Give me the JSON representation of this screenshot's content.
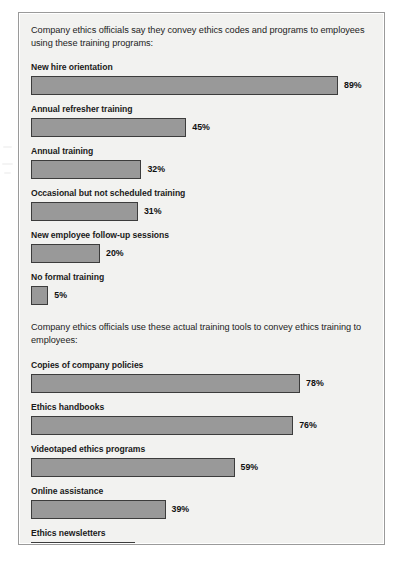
{
  "figure": {
    "background_color": "#f2f2f0",
    "frame_color": "#9a9a9a",
    "bar_fill_color": "#999999",
    "bar_border_color": "#3c3c3c",
    "text_color": "#232323"
  },
  "sections": [
    {
      "intro": "Company ethics officials say they convey ethics codes and programs to employees using these training programs:",
      "items": [
        {
          "label": "New hire orientation",
          "value": 89,
          "value_label": "89%"
        },
        {
          "label": "Annual refresher training",
          "value": 45,
          "value_label": "45%"
        },
        {
          "label": "Annual training",
          "value": 32,
          "value_label": "32%"
        },
        {
          "label": "Occasional but not scheduled training",
          "value": 31,
          "value_label": "31%"
        },
        {
          "label": "New employee follow-up sessions",
          "value": 20,
          "value_label": "20%"
        },
        {
          "label": "No formal training",
          "value": 5,
          "value_label": "5%"
        }
      ]
    },
    {
      "intro": "Company ethics officials use these actual training tools to convey ethics training to employees:",
      "items": [
        {
          "label": "Copies of company policies",
          "value": 78,
          "value_label": "78%"
        },
        {
          "label": "Ethics handbooks",
          "value": 76,
          "value_label": "76%"
        },
        {
          "label": "Videotaped ethics programs",
          "value": 59,
          "value_label": "59%"
        },
        {
          "label": "Online assistance",
          "value": 39,
          "value_label": "39%"
        },
        {
          "label": "Ethics newsletters",
          "value": 30,
          "value_label": "30%"
        }
      ]
    }
  ],
  "chart_data": {
    "type": "bar",
    "orientation": "horizontal",
    "title": "",
    "xlabel": "",
    "ylabel": "",
    "xlim": [
      0,
      100
    ],
    "grid": false,
    "legend": false,
    "units": "percent",
    "panels": [
      {
        "subtitle": "Company ethics officials say they convey ethics codes and programs to employees using these training programs:",
        "categories": [
          "New hire orientation",
          "Annual refresher training",
          "Annual training",
          "Occasional but not scheduled training",
          "New employee follow-up sessions",
          "No formal training"
        ],
        "values": [
          89,
          45,
          32,
          31,
          20,
          5
        ]
      },
      {
        "subtitle": "Company ethics officials use these actual training tools to convey ethics training to employees:",
        "categories": [
          "Copies of company policies",
          "Ethics handbooks",
          "Videotaped ethics programs",
          "Online assistance",
          "Ethics newsletters"
        ],
        "values": [
          78,
          76,
          59,
          39,
          30
        ]
      }
    ]
  }
}
